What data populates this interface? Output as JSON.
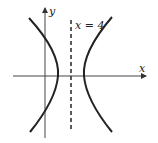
{
  "figure": {
    "type": "hyperbola-graph",
    "axes": {
      "x_label": "x",
      "y_label": "y"
    },
    "asymptote_label": "x = 4",
    "colors": {
      "curve": "#222222",
      "axis": "#333333",
      "background": "#ffffff"
    }
  }
}
